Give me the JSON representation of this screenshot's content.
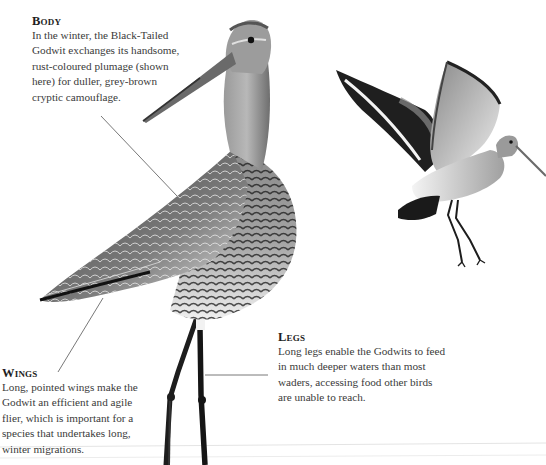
{
  "captions": {
    "body": {
      "heading": "Body",
      "text": "In the winter, the Black-Tailed Godwit exchanges its handsome, rust-coloured plumage (shown here) for duller, grey-brown cryptic camouflage."
    },
    "wings": {
      "heading": "Wings",
      "text": "Long, pointed wings make the Godwit an efficient and agile flier, which is important for a species that undertakes long, winter migrations."
    },
    "legs": {
      "heading": "Legs",
      "text": "Long legs enable the Godwits to feed in much deeper waters than most waders, accessing food other birds are unable to reach."
    }
  },
  "illustrations": {
    "standing_bird": "black-tailed-godwit-standing",
    "flying_bird": "black-tailed-godwit-in-flight"
  },
  "colors": {
    "text": "#3a3a3a",
    "heading": "#1e1e1e",
    "leader_line": "#555555",
    "plumage_dark": "#1c1c1c",
    "plumage_mid": "#7a7a7a",
    "plumage_light": "#d8d8d8"
  }
}
